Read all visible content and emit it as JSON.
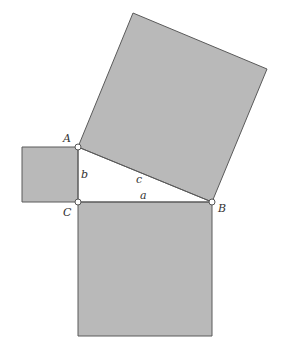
{
  "diagram": {
    "colors": {
      "fill": "#b9b9b9",
      "stroke": "#5a5a5a",
      "background": "#ffffff"
    },
    "vertices": {
      "A": {
        "label": "A",
        "x": 78,
        "y": 147
      },
      "B": {
        "label": "B",
        "x": 212,
        "y": 202
      },
      "C": {
        "label": "C",
        "x": 78,
        "y": 202
      }
    },
    "sides": {
      "a": {
        "label": "a",
        "between": "C-B"
      },
      "b": {
        "label": "b",
        "between": "A-C"
      },
      "c": {
        "label": "c",
        "between": "A-B"
      }
    },
    "squares": [
      {
        "name": "square-on-a",
        "points": "78,202 212,202 212,336 78,336"
      },
      {
        "name": "square-on-b",
        "points": "22,147 78,147 78,202 22,202"
      },
      {
        "name": "square-on-c",
        "points": "78,147 212,202 267,69 133,13"
      }
    ]
  }
}
